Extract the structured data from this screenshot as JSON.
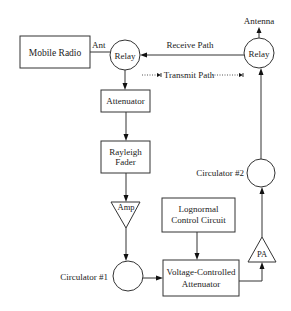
{
  "diagram": {
    "title": "",
    "nodes": {
      "mobile_radio": {
        "label": "Mobile Radio"
      },
      "relay_left": {
        "label": "Relay"
      },
      "relay_right": {
        "label": "Relay"
      },
      "antenna": {
        "label": "Antenna"
      },
      "attenuator": {
        "label": "Attenuator"
      },
      "rayleigh_fader": {
        "line1": "Rayleigh",
        "line2": "Fader"
      },
      "amp": {
        "label": "Amp"
      },
      "circulator1": {
        "label": "Circulator #1"
      },
      "lognormal": {
        "line1": "Lognormal",
        "line2": "Control Circuit"
      },
      "vca": {
        "line1": "Voltage-Controlled",
        "line2": "Attenuator"
      },
      "pa": {
        "label": "PA"
      },
      "circulator2": {
        "label": "Circulator #2"
      }
    },
    "edge_labels": {
      "ant": "Ant",
      "receive_path": "Receive Path",
      "transmit_path": "Transmit Path"
    },
    "edges": [
      {
        "from": "mobile_radio",
        "to": "relay_left",
        "label": "Ant",
        "style": "solid",
        "arrow": false
      },
      {
        "from": "relay_right",
        "to": "relay_left",
        "label": "Receive Path",
        "style": "solid",
        "arrow": true
      },
      {
        "from": "relay_left",
        "to": "relay_right",
        "label": "Transmit Path",
        "style": "dotted",
        "arrow": true
      },
      {
        "from": "relay_right",
        "to": "antenna",
        "style": "solid",
        "arrow": true
      },
      {
        "from": "relay_left",
        "to": "attenuator",
        "style": "solid",
        "arrow": true
      },
      {
        "from": "attenuator",
        "to": "rayleigh_fader",
        "style": "solid",
        "arrow": true
      },
      {
        "from": "rayleigh_fader",
        "to": "amp",
        "style": "solid",
        "arrow": true
      },
      {
        "from": "amp",
        "to": "circulator1",
        "style": "solid",
        "arrow": true
      },
      {
        "from": "circulator1",
        "to": "vca",
        "style": "solid",
        "arrow": true
      },
      {
        "from": "lognormal",
        "to": "vca",
        "style": "solid",
        "arrow": true
      },
      {
        "from": "vca",
        "to": "pa",
        "style": "solid",
        "arrow": true
      },
      {
        "from": "pa",
        "to": "circulator2",
        "style": "solid",
        "arrow": true
      },
      {
        "from": "circulator2",
        "to": "relay_right",
        "style": "solid",
        "arrow": true
      }
    ]
  }
}
